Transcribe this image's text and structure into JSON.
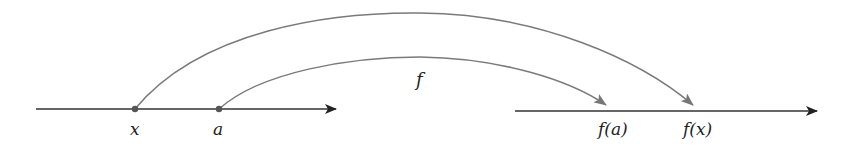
{
  "diagram": {
    "domain_line": {
      "points": [
        {
          "label": "x"
        },
        {
          "label": "a"
        }
      ]
    },
    "codomain_line": {
      "points": [
        {
          "label": "f(a)"
        },
        {
          "label": "f(x)"
        }
      ]
    },
    "function_label": "f",
    "mappings": [
      {
        "from": "x",
        "to": "f(x)"
      },
      {
        "from": "a",
        "to": "f(a)"
      }
    ],
    "colors": {
      "axis": "#333333",
      "arc": "#7a7a7a",
      "dot": "#555555"
    }
  }
}
